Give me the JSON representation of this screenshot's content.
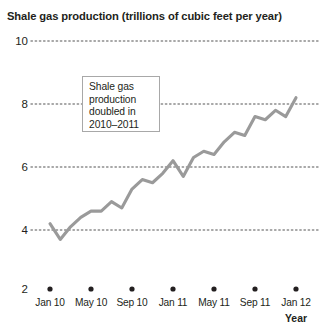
{
  "chart_data": {
    "type": "line",
    "title": "Shale gas production (trillions of cubic feet per year)",
    "xlabel": "Year",
    "ylabel": "",
    "ylim": [
      2,
      10
    ],
    "yticks": [
      2,
      4,
      6,
      8,
      10
    ],
    "ytick_labels": [
      "2",
      "4",
      "6",
      "8",
      "10"
    ],
    "grid": "dotted-horizontal",
    "legend": "none",
    "xtick_labels": [
      "Jan 10",
      "May 10",
      "Sep 10",
      "Jan 11",
      "May 11",
      "Sep 11",
      "Jan 12"
    ],
    "xtick_values": [
      "2010-01",
      "2010-05",
      "2010-09",
      "2011-01",
      "2011-05",
      "2011-09",
      "2012-01"
    ],
    "series_name": "Shale gas production",
    "series_color": "#9a9a9a",
    "x": [
      "2010-01",
      "2010-02",
      "2010-03",
      "2010-04",
      "2010-05",
      "2010-06",
      "2010-07",
      "2010-08",
      "2010-09",
      "2010-10",
      "2010-11",
      "2010-12",
      "2011-01",
      "2011-02",
      "2011-03",
      "2011-04",
      "2011-05",
      "2011-06",
      "2011-07",
      "2011-08",
      "2011-09",
      "2011-10",
      "2011-11",
      "2011-12",
      "2012-01"
    ],
    "values": [
      4.2,
      3.7,
      4.1,
      4.4,
      4.6,
      4.6,
      4.9,
      4.7,
      5.3,
      5.6,
      5.5,
      5.8,
      6.2,
      5.7,
      6.3,
      6.5,
      6.4,
      6.8,
      7.1,
      7.0,
      7.6,
      7.5,
      7.8,
      7.6,
      8.2
    ],
    "annotation": {
      "line1": "Shale gas",
      "line2": "production",
      "line3": "doubled in",
      "line4": "2010–2011",
      "text": "Shale gas production doubled in 2010–2011"
    }
  }
}
